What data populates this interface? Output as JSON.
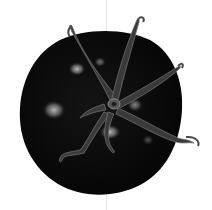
{
  "image": {
    "subject": "tomato viewed from above with calyx",
    "style": "black and white illustration",
    "colors": {
      "background": "#ffffff",
      "fruit": "#0c0c0c",
      "highlight": "#9a9a9a",
      "calyx": "#3a3a3a",
      "calyx_light": "#6e6e6e",
      "fold_line": "#e6e6e6"
    }
  }
}
